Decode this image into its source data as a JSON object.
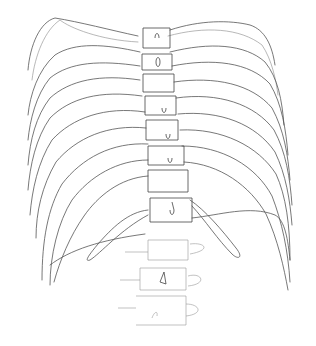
{
  "image": {
    "description": "Pencil line sketch of a human rib cage and thoracic/lumbar spine, front view",
    "background": "#ffffff",
    "stroke_color": "#555555",
    "subject": "rib-cage-and-spine-sketch"
  }
}
